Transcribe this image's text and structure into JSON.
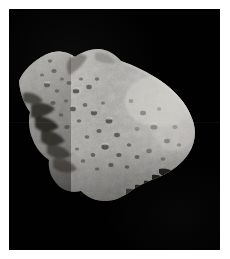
{
  "image": {
    "subject": "asteroid",
    "subject_name": "irregular cratered asteroid",
    "alt_text": "Grayscale photograph of an elongated, heavily cratered asteroid against the black of space",
    "background_color": "#010101",
    "border_color": "#ffffff",
    "body_color_light": "#c8c6c2",
    "body_color_mid": "#9c9a96",
    "body_color_dark": "#4a4846",
    "terminator_color": "#141414",
    "width": 230,
    "height": 259,
    "photo": {
      "left": 9,
      "top": 9,
      "width": 211,
      "height": 241
    }
  },
  "scene": {
    "orientation": "elongated body running from upper-left to lower-right",
    "illumination": "lit from upper right, shadowed along lower-left limb",
    "features": [
      "twin ridge bumps along the upper limb",
      "dense small crater field across the left lobe",
      "broad smooth bright flank on the right lobe",
      "finger-like shadow streaks at the lower-right limb",
      "deep shadowed notch along the left terminator"
    ]
  }
}
